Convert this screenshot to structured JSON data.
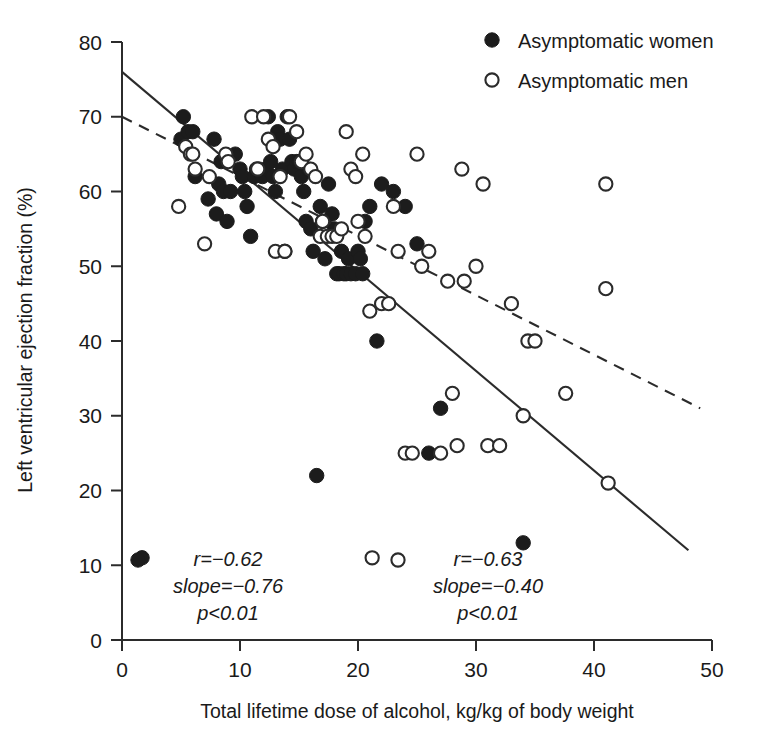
{
  "chart_data": {
    "type": "scatter",
    "title": "",
    "xlabel": "Total lifetime dose of alcohol, kg/kg of body weight",
    "ylabel": "Left ventricular ejection fraction (%)",
    "xlim": [
      0,
      50
    ],
    "ylim": [
      0,
      80
    ],
    "xticks": [
      "0",
      "10",
      "20",
      "30",
      "40",
      "50"
    ],
    "yticks": [
      "0",
      "10",
      "20",
      "30",
      "40",
      "50",
      "60",
      "70",
      "80"
    ],
    "xtick_values": [
      0,
      10,
      20,
      30,
      40,
      50
    ],
    "ytick_values": [
      0,
      10,
      20,
      30,
      40,
      50,
      60,
      70,
      80
    ],
    "grid": false,
    "legend_position": "top-right",
    "legend": [
      {
        "marker": "filled-circle",
        "label": "Asymptomatic women"
      },
      {
        "marker": "open-circle",
        "label": "Asymptomatic men"
      }
    ],
    "series": [
      {
        "name": "Asymptomatic women",
        "marker": "filled-circle",
        "color": "#1c1c1c",
        "points": [
          [
            1.7,
            11
          ],
          [
            5.0,
            67
          ],
          [
            5.2,
            70
          ],
          [
            5.6,
            68
          ],
          [
            6.0,
            68
          ],
          [
            6.2,
            62
          ],
          [
            7.3,
            59
          ],
          [
            7.8,
            67
          ],
          [
            8.0,
            57
          ],
          [
            8.2,
            61
          ],
          [
            8.4,
            64
          ],
          [
            8.6,
            60
          ],
          [
            8.9,
            56
          ],
          [
            9.2,
            60
          ],
          [
            9.6,
            65
          ],
          [
            10.0,
            63
          ],
          [
            10.2,
            62
          ],
          [
            10.4,
            60
          ],
          [
            10.6,
            58
          ],
          [
            10.9,
            54
          ],
          [
            11.2,
            62
          ],
          [
            11.4,
            63
          ],
          [
            11.6,
            63
          ],
          [
            11.9,
            62
          ],
          [
            12.2,
            63
          ],
          [
            12.4,
            70
          ],
          [
            12.6,
            64
          ],
          [
            12.8,
            62
          ],
          [
            13.0,
            60
          ],
          [
            13.2,
            68
          ],
          [
            13.4,
            67
          ],
          [
            13.6,
            63
          ],
          [
            13.8,
            52
          ],
          [
            14.0,
            70
          ],
          [
            14.2,
            67
          ],
          [
            14.4,
            64
          ],
          [
            14.6,
            63
          ],
          [
            14.8,
            64
          ],
          [
            15.0,
            64
          ],
          [
            15.2,
            62
          ],
          [
            15.4,
            60
          ],
          [
            15.6,
            56
          ],
          [
            15.8,
            63
          ],
          [
            16.0,
            55
          ],
          [
            16.2,
            52
          ],
          [
            16.5,
            22
          ],
          [
            16.8,
            58
          ],
          [
            17.0,
            56
          ],
          [
            17.2,
            51
          ],
          [
            17.5,
            61
          ],
          [
            17.8,
            57
          ],
          [
            18.0,
            55
          ],
          [
            18.2,
            49
          ],
          [
            18.4,
            49
          ],
          [
            18.6,
            52
          ],
          [
            18.8,
            49
          ],
          [
            19.0,
            49
          ],
          [
            19.2,
            51
          ],
          [
            19.4,
            49
          ],
          [
            19.8,
            49
          ],
          [
            20.0,
            52
          ],
          [
            20.2,
            51
          ],
          [
            20.4,
            49
          ],
          [
            20.6,
            56
          ],
          [
            21.0,
            58
          ],
          [
            21.6,
            40
          ],
          [
            22.0,
            61
          ],
          [
            23.0,
            60
          ],
          [
            24.0,
            58
          ],
          [
            25.0,
            53
          ],
          [
            26.0,
            25
          ],
          [
            27.0,
            31
          ],
          [
            34.0,
            13
          ]
        ]
      },
      {
        "name": "Asymptomatic men",
        "marker": "open-circle",
        "color": "#ffffff",
        "points": [
          [
            4.8,
            58
          ],
          [
            5.4,
            66
          ],
          [
            5.8,
            65
          ],
          [
            6.0,
            65
          ],
          [
            6.2,
            63
          ],
          [
            7.0,
            53
          ],
          [
            7.4,
            62
          ],
          [
            8.8,
            65
          ],
          [
            9.0,
            64
          ],
          [
            11.0,
            70
          ],
          [
            11.5,
            63
          ],
          [
            12.0,
            70
          ],
          [
            12.4,
            67
          ],
          [
            12.8,
            66
          ],
          [
            13.0,
            52
          ],
          [
            13.4,
            62
          ],
          [
            13.8,
            52
          ],
          [
            14.2,
            70
          ],
          [
            14.8,
            68
          ],
          [
            15.2,
            64
          ],
          [
            15.6,
            65
          ],
          [
            16.0,
            63
          ],
          [
            16.4,
            62
          ],
          [
            16.8,
            54
          ],
          [
            17.0,
            56
          ],
          [
            17.4,
            54
          ],
          [
            17.8,
            54
          ],
          [
            18.2,
            54
          ],
          [
            18.6,
            55
          ],
          [
            19.0,
            68
          ],
          [
            19.4,
            63
          ],
          [
            19.8,
            62
          ],
          [
            20.0,
            56
          ],
          [
            20.4,
            65
          ],
          [
            20.6,
            54
          ],
          [
            21.0,
            44
          ],
          [
            21.2,
            11
          ],
          [
            22.0,
            45
          ],
          [
            22.6,
            45
          ],
          [
            23.0,
            58
          ],
          [
            23.4,
            52
          ],
          [
            24.0,
            25
          ],
          [
            24.6,
            25
          ],
          [
            25.0,
            65
          ],
          [
            25.4,
            50
          ],
          [
            26.0,
            52
          ],
          [
            27.0,
            25
          ],
          [
            27.6,
            48
          ],
          [
            28.0,
            33
          ],
          [
            28.4,
            26
          ],
          [
            28.8,
            63
          ],
          [
            29.0,
            48
          ],
          [
            30.0,
            50
          ],
          [
            30.6,
            61
          ],
          [
            31.0,
            26
          ],
          [
            32.0,
            26
          ],
          [
            33.0,
            45
          ],
          [
            34.0,
            30
          ],
          [
            34.4,
            40
          ],
          [
            35.0,
            40
          ],
          [
            37.6,
            33
          ],
          [
            41.0,
            61
          ],
          [
            41.0,
            47
          ],
          [
            41.2,
            21
          ]
        ]
      }
    ],
    "fit_lines": [
      {
        "name": "women-regression",
        "style": "solid",
        "x_start": 0,
        "y_start": 76,
        "x_end": 48,
        "y_end": 12
      },
      {
        "name": "men-regression",
        "style": "dashed",
        "x_start": 0,
        "y_start": 70,
        "x_end": 49,
        "y_end": 31
      }
    ],
    "annotations": [
      {
        "name": "women-stats",
        "marker": "filled-circle",
        "lines": [
          "r=−0.62",
          "slope=−0.76",
          "p<0.01"
        ],
        "r": "r=−0.62",
        "slope": "slope=−0.76",
        "p": "p<0.01"
      },
      {
        "name": "men-stats",
        "marker": "open-circle",
        "lines": [
          "r=−0.63",
          "slope=−0.40",
          "p<0.01"
        ],
        "r": "r=−0.63",
        "slope": "slope=−0.40",
        "p": "p<0.01"
      }
    ]
  },
  "colors": {
    "axis": "#2b2b2b",
    "filled_marker": "#1c1c1c",
    "open_marker_stroke": "#2b2b2b",
    "background": "#ffffff"
  }
}
